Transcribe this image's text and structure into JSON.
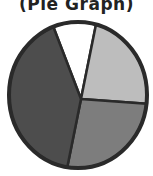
{
  "chart_data": {
    "type": "pie",
    "title": "(Pie Graph)",
    "slices": [
      {
        "label": "",
        "value": 9,
        "color": "#ffffff"
      },
      {
        "label": "",
        "value": 23,
        "color": "#bdbdbd"
      },
      {
        "label": "",
        "value": 27,
        "color": "#7d7d7d"
      },
      {
        "label": "",
        "value": 41,
        "color": "#4d4d4d"
      }
    ],
    "start_angle_deg": 339,
    "legend": "none"
  }
}
